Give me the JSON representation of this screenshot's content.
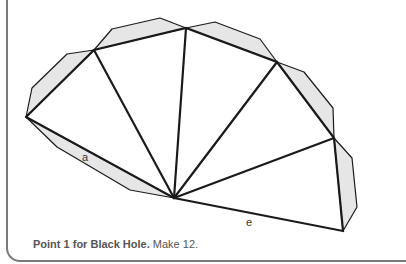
{
  "diagram": {
    "center_vertex": [
      174,
      198
    ],
    "outer_vertices": [
      [
        26,
        117
      ],
      [
        94,
        50
      ],
      [
        186,
        28
      ],
      [
        277,
        62
      ],
      [
        334,
        138
      ],
      [
        343,
        231
      ]
    ],
    "flaps": [
      {
        "points": [
          [
            26,
            117
          ],
          [
            32,
            88
          ],
          [
            67,
            54
          ],
          [
            94,
            50
          ]
        ]
      },
      {
        "points": [
          [
            94,
            50
          ],
          [
            112,
            29
          ],
          [
            160,
            18
          ],
          [
            186,
            28
          ]
        ]
      },
      {
        "points": [
          [
            186,
            28
          ],
          [
            215,
            22
          ],
          [
            260,
            39
          ],
          [
            277,
            62
          ]
        ]
      },
      {
        "points": [
          [
            277,
            62
          ],
          [
            304,
            72
          ],
          [
            333,
            108
          ],
          [
            334,
            138
          ]
        ]
      },
      {
        "points": [
          [
            334,
            138
          ],
          [
            352,
            158
          ],
          [
            357,
            207
          ],
          [
            343,
            231
          ]
        ]
      },
      {
        "points": [
          [
            26,
            117
          ],
          [
            57,
            147
          ],
          [
            130,
            190
          ],
          [
            174,
            198
          ]
        ]
      }
    ],
    "edge_labels": [
      {
        "text": "a",
        "x": 82,
        "y": 161
      },
      {
        "text": "e",
        "x": 246,
        "y": 226
      }
    ],
    "colors": {
      "flap_fill": "#e6e6e6",
      "line": "#1a1a1a",
      "frame": "#7a7a7a"
    }
  },
  "caption": {
    "bold": "Point 1 for Black Hole.",
    "rest": " Make 12."
  }
}
